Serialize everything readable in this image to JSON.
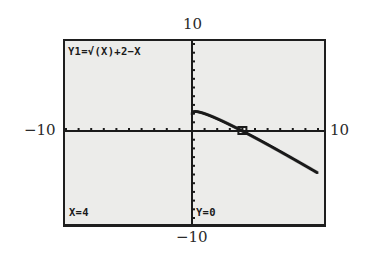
{
  "window": {
    "ymax_label": "10",
    "ymin_label": "−10",
    "xmin_label": "−10",
    "xmax_label": "10"
  },
  "screen": {
    "equation": "Y1=√(X)+2−X",
    "x_readout": "X=4",
    "y_readout": "Y=0"
  },
  "colors": {
    "screen_bg": "#ececea",
    "ink": "#1a1a1a"
  },
  "chart_data": {
    "type": "line",
    "title": "Y1=√(X)+2−X",
    "xlabel": "",
    "ylabel": "",
    "xlim": [
      -10,
      10
    ],
    "ylim": [
      -10,
      10
    ],
    "grid": false,
    "x_tick_step": 1,
    "y_tick_step": 1,
    "series": [
      {
        "name": "Y1",
        "x": [
          0,
          0.25,
          1,
          2,
          3,
          4,
          5,
          6,
          7,
          8,
          9,
          10
        ],
        "y": [
          2,
          1.75,
          2,
          1.41,
          0.73,
          0,
          -0.76,
          -1.55,
          -2.35,
          -3.17,
          -4,
          -4.84
        ]
      }
    ],
    "trace_cursor": {
      "x": 4,
      "y": 0
    },
    "annotations": [
      "X=4",
      "Y=0"
    ]
  }
}
